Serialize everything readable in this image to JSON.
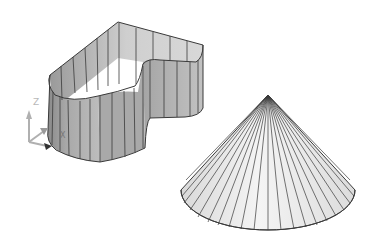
{
  "viewport": {
    "background": "#ffffff",
    "edge_color": "#3a3a3a",
    "shade_light": "#f2f2f2",
    "shade_mid": "#b4b4b4",
    "shade_dark": "#8c8c8c"
  },
  "objects": [
    {
      "name": "extruded-heart-profile",
      "type": "extruded open profile surface",
      "facet_count_visible": 24
    },
    {
      "name": "cone",
      "type": "cone surface",
      "facet_count_visible": 22
    }
  ],
  "ucs_icon": {
    "z_label": "Z",
    "x_label": "X",
    "axis_color": "#b0b0b0",
    "origin_marker_color": "#333333"
  }
}
